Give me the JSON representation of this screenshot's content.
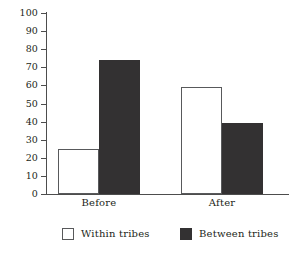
{
  "chart_data": {
    "type": "bar",
    "title": "",
    "subtitle": "",
    "xlabel": "",
    "ylabel": "",
    "categories": [
      "Before",
      "After"
    ],
    "series": [
      {
        "name": "Within tribes",
        "values": [
          25,
          59
        ],
        "color": "#ffffff",
        "style": "outlined"
      },
      {
        "name": "Between tribes",
        "values": [
          74,
          39
        ],
        "color": "#333132",
        "style": "filled"
      }
    ],
    "ylim": [
      0,
      100
    ],
    "ytick_step": 10,
    "yticks": [
      100,
      90,
      80,
      70,
      60,
      50,
      40,
      30,
      20,
      10,
      0
    ],
    "ytick_labels": [
      "100",
      "90",
      "80",
      "70",
      "60",
      "50",
      "40",
      "30",
      "20",
      "10",
      "0"
    ],
    "grid": false,
    "legend_position": "bottom",
    "axis_color": "#4d4d4d",
    "text_color": "#231f20",
    "background": "#ffffff"
  },
  "legend": {
    "items": [
      {
        "label": "Within tribes",
        "swatch": "open-square-swatch"
      },
      {
        "label": "Between tribes",
        "swatch": "filled-square-swatch"
      }
    ]
  }
}
